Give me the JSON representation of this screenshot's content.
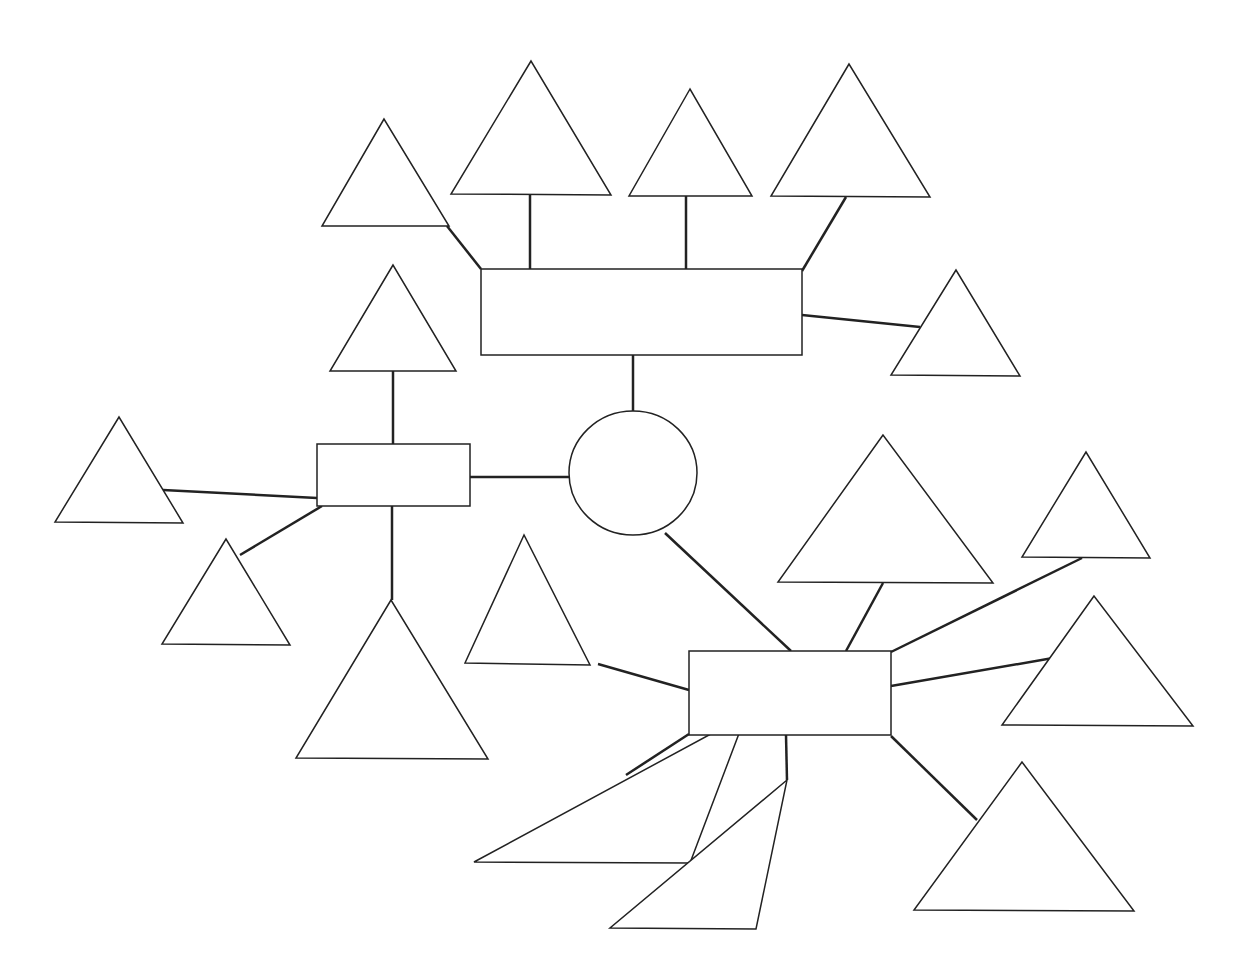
{
  "diagram": {
    "title": "",
    "type": "blank mind map / graphic organizer",
    "center": {
      "shape": "circle",
      "cx": 633,
      "cy": 473,
      "rx": 64,
      "ry": 62
    },
    "boxes": [
      {
        "id": "top-box",
        "x": 481,
        "y": 269,
        "w": 321,
        "h": 86
      },
      {
        "id": "left-box",
        "x": 317,
        "y": 444,
        "w": 153,
        "h": 62
      },
      {
        "id": "bottom-right-box",
        "x": 689,
        "y": 651,
        "w": 202,
        "h": 84
      }
    ],
    "triangles": [
      {
        "id": "t1",
        "points": "384,119 322,226 449,226"
      },
      {
        "id": "t2",
        "points": "531,61 451,194 611,195"
      },
      {
        "id": "t3",
        "points": "690,89 629,196 752,196"
      },
      {
        "id": "t4",
        "points": "849,64 771,196 930,197"
      },
      {
        "id": "t5",
        "points": "956,270 891,375 1020,376"
      },
      {
        "id": "t6",
        "points": "393,265 330,371 456,371"
      },
      {
        "id": "t7",
        "points": "119,417 55,522 183,523"
      },
      {
        "id": "t8",
        "points": "226,539 162,644 290,645"
      },
      {
        "id": "t9",
        "points": "391,600 296,758 488,759"
      },
      {
        "id": "t10",
        "points": "524,535 465,663 590,665"
      },
      {
        "id": "t11",
        "points": "746,715 474,862 690,863"
      },
      {
        "id": "t12",
        "points": "787,780 610,928 756,929"
      },
      {
        "id": "t13",
        "points": "1022,762 914,910 1134,911"
      },
      {
        "id": "t14",
        "points": "883,435 778,582 993,583"
      },
      {
        "id": "t15",
        "points": "1086,452 1022,557 1150,558"
      },
      {
        "id": "t16",
        "points": "1094,596 1002,725 1193,726"
      }
    ],
    "links": [
      {
        "from": "t1",
        "to": "top-box",
        "x1": 447,
        "y1": 226,
        "x2": 481,
        "y2": 269
      },
      {
        "from": "t2",
        "to": "top-box",
        "x1": 530,
        "y1": 195,
        "x2": 530,
        "y2": 269
      },
      {
        "from": "t3",
        "to": "top-box",
        "x1": 686,
        "y1": 196,
        "x2": 686,
        "y2": 270
      },
      {
        "from": "t4",
        "to": "top-box",
        "x1": 846,
        "y1": 197,
        "x2": 802,
        "y2": 271
      },
      {
        "from": "top-box",
        "to": "t5",
        "x1": 802,
        "y1": 315,
        "x2": 920,
        "y2": 327
      },
      {
        "from": "top-box",
        "to": "center",
        "x1": 633,
        "y1": 355,
        "x2": 633,
        "y2": 411
      },
      {
        "from": "t6",
        "to": "left-box",
        "x1": 393,
        "y1": 371,
        "x2": 393,
        "y2": 444
      },
      {
        "from": "left-box",
        "to": "center",
        "x1": 470,
        "y1": 477,
        "x2": 569,
        "y2": 477
      },
      {
        "from": "t7",
        "to": "left-box",
        "x1": 163,
        "y1": 490,
        "x2": 317,
        "y2": 498
      },
      {
        "from": "left-box",
        "to": "t8",
        "x1": 322,
        "y1": 506,
        "x2": 240,
        "y2": 555
      },
      {
        "from": "left-box",
        "to": "t9",
        "x1": 392,
        "y1": 506,
        "x2": 392,
        "y2": 600
      },
      {
        "from": "center",
        "to": "bottom-right-box",
        "x1": 665,
        "y1": 533,
        "x2": 791,
        "y2": 651
      },
      {
        "from": "t10",
        "to": "bottom-right-box",
        "x1": 598,
        "y1": 664,
        "x2": 689,
        "y2": 690
      },
      {
        "from": "t14",
        "to": "bottom-right-box",
        "x1": 883,
        "y1": 583,
        "x2": 846,
        "y2": 651
      },
      {
        "from": "t15",
        "to": "bottom-right-box",
        "x1": 1082,
        "y1": 558,
        "x2": 891,
        "y2": 652
      },
      {
        "from": "t16",
        "to": "bottom-right-box",
        "x1": 1053,
        "y1": 658,
        "x2": 891,
        "y2": 686
      },
      {
        "from": "bottom-right-box",
        "to": "t11",
        "x1": 689,
        "y1": 734,
        "x2": 626,
        "y2": 775
      },
      {
        "from": "bottom-right-box",
        "to": "t12",
        "x1": 786,
        "y1": 735,
        "x2": 787,
        "y2": 780
      },
      {
        "from": "bottom-right-box",
        "to": "t13",
        "x1": 891,
        "y1": 736,
        "x2": 977,
        "y2": 820
      }
    ]
  }
}
